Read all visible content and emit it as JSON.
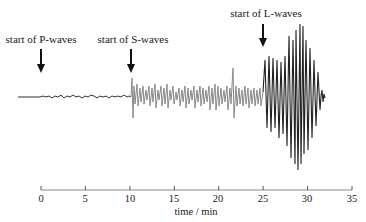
{
  "diagram": {
    "type": "seismogram",
    "annotations": [
      {
        "label": "start of P-waves",
        "time": 0
      },
      {
        "label": "start of S-waves",
        "time": 10
      },
      {
        "label": "start of L-waves",
        "time": 25
      }
    ],
    "axis": {
      "title": "time / min",
      "ticks": [
        "0",
        "5",
        "10",
        "15",
        "20",
        "25",
        "30",
        "35"
      ],
      "range": [
        0,
        35
      ]
    },
    "colors": {
      "trace": "#333333",
      "s_wave_trace": "#8a8a8a",
      "l_wave_trace": "#222222",
      "axis": "#888888"
    }
  }
}
